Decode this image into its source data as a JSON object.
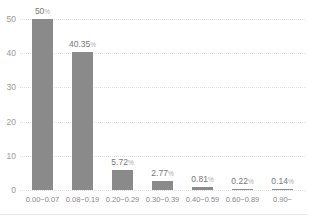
{
  "chart_data": {
    "type": "bar",
    "title": "",
    "xlabel": "",
    "ylabel": "",
    "categories": [
      "0.00~0.07",
      "0.08~0.19",
      "0.20~0.29",
      "0.30~0.39",
      "0.40~0.59",
      "0.60~0.89",
      "0.90~"
    ],
    "values": [
      50,
      40.35,
      5.72,
      2.77,
      0.81,
      0.22,
      0.14
    ],
    "value_labels": [
      "50",
      "40.35",
      "5.72",
      "2.77",
      "0.81",
      "0.22",
      "0.14"
    ],
    "value_suffix": "%",
    "y_ticks": [
      0,
      10,
      20,
      30,
      40,
      50
    ],
    "ylim": [
      0,
      50
    ],
    "legend": null,
    "grid": "horizontal-dotted",
    "colors": {
      "bar": "#8a8a8a",
      "gridline": "#e0e0e0",
      "y_tick_text": "#9a9a9a",
      "x_tick_text": "#888888",
      "value_label_text": "#777777",
      "value_suffix_text": "#aaaaaa",
      "background": "#ffffff"
    }
  }
}
